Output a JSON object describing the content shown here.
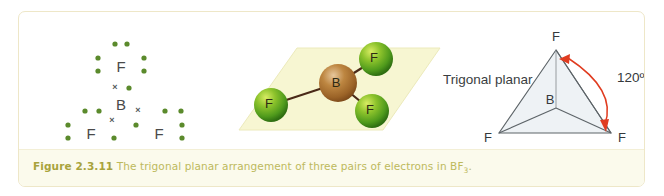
{
  "figure": {
    "caption_label": "Figure 2.3.11",
    "caption_body": "The trigonal planar arrangement of three pairs of electrons in BF",
    "caption_subscript": "3",
    "caption_end": ".",
    "colors": {
      "page_background": "#ffffff",
      "box_border": "#eee7c8",
      "caption_band": "#fbfaec",
      "caption_label_color": "#a8a33c",
      "caption_body_color": "#bdb95c",
      "electron_dot_green": "#5b8a2c",
      "cross_gray": "#54595c",
      "plane_yellow": "#f7f6d2",
      "fluorine_sphere_green": "#5aa021",
      "fluorine_highlight": "#c3e04a",
      "boron_sphere_brown": "#a9712f",
      "boron_highlight": "#e8c89a",
      "bond_brown": "#4a2a18",
      "geometry_fill": "#eef2f5",
      "geometry_edge": "#5d6468",
      "angle_arrow_red": "#e03c20"
    }
  },
  "lewis_diagram": {
    "name": "dot-and-cross diagram of BF3",
    "central_atom": "B",
    "outer_atoms": [
      "F",
      "F",
      "F"
    ],
    "dot_symbol": "•",
    "cross_symbol": "×",
    "note": "each fluorine carries seven green electron dots plus one cross from boron"
  },
  "model_3d": {
    "name": "ball-and-stick model of BF3 on a plane",
    "central_label": "B",
    "outer_labels": [
      "F",
      "F",
      "F"
    ],
    "plane_shape": "parallelogram"
  },
  "geometry_diagram": {
    "shape_name": "Trigonal planar",
    "center_label": "B",
    "vertex_labels": [
      "F",
      "F",
      "F"
    ],
    "bond_angle": "120º"
  }
}
